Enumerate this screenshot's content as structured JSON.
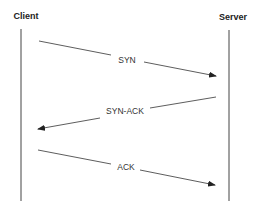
{
  "diagram": {
    "type": "sequence",
    "colors": {
      "line": "#333333",
      "text": "#222222",
      "background": "#ffffff"
    },
    "actors": [
      {
        "label": "Client",
        "x": 21,
        "label_x": 26,
        "label_y": 19
      },
      {
        "label": "Server",
        "x": 229,
        "label_x": 233,
        "label_y": 20
      }
    ],
    "messages": [
      {
        "label": "SYN",
        "from": "Client",
        "to": "Server",
        "x1": 39,
        "y1": 41,
        "x2": 216,
        "y2": 76,
        "label_x": 127,
        "label_y": 63
      },
      {
        "label": "SYN-ACK",
        "from": "Server",
        "to": "Client",
        "x1": 216,
        "y1": 97,
        "x2": 38,
        "y2": 129,
        "label_x": 125,
        "label_y": 114
      },
      {
        "label": "ACK",
        "from": "Client",
        "to": "Server",
        "x1": 38,
        "y1": 150,
        "x2": 215,
        "y2": 185,
        "label_x": 126,
        "label_y": 170
      }
    ]
  }
}
